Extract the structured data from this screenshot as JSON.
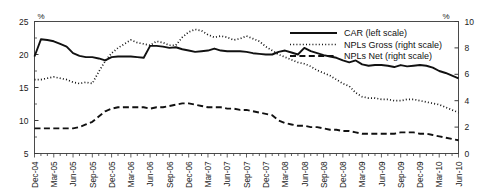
{
  "figure": {
    "title_partial": "",
    "left_unit": "%",
    "right_unit": "%"
  },
  "axes": {
    "left_ticks": [
      "25",
      "20",
      "15",
      "10",
      "5"
    ],
    "right_ticks": [
      "10",
      "8",
      "6",
      "4",
      "2",
      "0"
    ],
    "x_ticks": [
      "Dec-04",
      "Mar-05",
      "Jun-05",
      "Sep-05",
      "Dec-05",
      "Mar-06",
      "Jun-06",
      "Sep-06",
      "Dec-06",
      "Mar-07",
      "Jun-07",
      "Sep-07",
      "Dec-07",
      "Mar-08",
      "Jun-08",
      "Sep-08",
      "Dec-08",
      "Mar-09",
      "Jun-09",
      "Sep-09",
      "Dec-09",
      "Mar-10",
      "Jun-10"
    ]
  },
  "legend": {
    "items": [
      {
        "label": "CAR (left scale)",
        "style": "solid",
        "color": "#111111"
      },
      {
        "label": "NPLs Gross (right scale)",
        "style": "dotted",
        "color": "#111111"
      },
      {
        "label": "NPLs Net (right scale)",
        "style": "dashed",
        "color": "#111111"
      }
    ]
  },
  "chart_data": {
    "type": "line",
    "title": "",
    "xlabel": "",
    "ylabel": "%",
    "ylabel_right": "%",
    "ylim": [
      5,
      25
    ],
    "ylim_right": [
      0,
      10
    ],
    "grid": false,
    "legend_position": "top-right",
    "x": [
      "Dec-04",
      "Jan-05",
      "Feb-05",
      "Mar-05",
      "Apr-05",
      "May-05",
      "Jun-05",
      "Jul-05",
      "Aug-05",
      "Sep-05",
      "Oct-05",
      "Nov-05",
      "Dec-05",
      "Jan-06",
      "Feb-06",
      "Mar-06",
      "Apr-06",
      "May-06",
      "Jun-06",
      "Jul-06",
      "Aug-06",
      "Sep-06",
      "Oct-06",
      "Nov-06",
      "Dec-06",
      "Jan-07",
      "Feb-07",
      "Mar-07",
      "Apr-07",
      "May-07",
      "Jun-07",
      "Jul-07",
      "Aug-07",
      "Sep-07",
      "Oct-07",
      "Nov-07",
      "Dec-07",
      "Jan-08",
      "Feb-08",
      "Mar-08",
      "Apr-08",
      "May-08",
      "Jun-08",
      "Jul-08",
      "Aug-08",
      "Sep-08",
      "Oct-08",
      "Nov-08",
      "Dec-08",
      "Jan-09",
      "Feb-09",
      "Mar-09",
      "Apr-09",
      "May-09",
      "Jun-09",
      "Jul-09",
      "Aug-09",
      "Sep-09",
      "Oct-09",
      "Nov-09",
      "Dec-09",
      "Jan-10",
      "Feb-10",
      "Mar-10",
      "Apr-10",
      "May-10",
      "Jun-10"
    ],
    "series": [
      {
        "name": "CAR (left scale)",
        "axis": "left",
        "style": "solid",
        "values": [
          19.7,
          22.3,
          22.2,
          22.0,
          21.6,
          21.2,
          20.2,
          19.8,
          19.6,
          19.6,
          19.4,
          19.1,
          19.6,
          19.7,
          19.7,
          19.7,
          19.6,
          19.5,
          21.3,
          21.3,
          21.2,
          21.0,
          21.1,
          20.8,
          20.6,
          20.4,
          20.5,
          20.6,
          20.9,
          20.6,
          20.5,
          20.5,
          20.5,
          20.4,
          20.2,
          20.1,
          20.0,
          20.0,
          20.4,
          20.6,
          20.3,
          20.0,
          21.0,
          20.5,
          20.2,
          19.9,
          19.7,
          19.5,
          19.1,
          18.8,
          19.1,
          18.5,
          18.3,
          18.4,
          18.4,
          18.3,
          18.1,
          18.4,
          18.2,
          18.3,
          18.4,
          18.3,
          18.0,
          17.5,
          17.2,
          16.8,
          16.4
        ]
      },
      {
        "name": "NPLs Gross (right scale)",
        "axis": "right",
        "style": "dotted",
        "values": [
          5.6,
          5.6,
          5.7,
          5.8,
          5.7,
          5.6,
          5.4,
          5.3,
          5.4,
          5.3,
          6.2,
          7.0,
          7.6,
          8.0,
          8.3,
          8.6,
          8.4,
          8.3,
          8.2,
          8.5,
          8.4,
          8.2,
          8.2,
          8.8,
          9.2,
          9.4,
          9.3,
          9.0,
          8.8,
          8.9,
          8.8,
          8.6,
          8.7,
          8.9,
          8.7,
          8.5,
          8.1,
          7.8,
          7.5,
          7.3,
          7.1,
          6.9,
          6.8,
          6.6,
          6.3,
          6.1,
          5.9,
          5.6,
          5.3,
          5.1,
          4.6,
          4.3,
          4.2,
          4.2,
          4.1,
          4.1,
          4.0,
          4.0,
          4.1,
          4.1,
          4.0,
          3.9,
          3.8,
          3.7,
          3.5,
          3.3,
          3.1
        ]
      },
      {
        "name": "NPLs Net (right scale)",
        "axis": "right",
        "style": "dashed",
        "values": [
          1.9,
          1.9,
          1.9,
          1.9,
          1.9,
          1.9,
          1.9,
          2.0,
          2.2,
          2.4,
          2.8,
          3.2,
          3.4,
          3.5,
          3.5,
          3.5,
          3.5,
          3.5,
          3.4,
          3.5,
          3.5,
          3.6,
          3.7,
          3.8,
          3.8,
          3.7,
          3.6,
          3.5,
          3.5,
          3.5,
          3.4,
          3.4,
          3.3,
          3.3,
          3.2,
          3.1,
          3.0,
          2.9,
          2.5,
          2.3,
          2.2,
          2.1,
          2.1,
          2.0,
          2.0,
          1.9,
          1.8,
          1.8,
          1.7,
          1.7,
          1.6,
          1.5,
          1.5,
          1.5,
          1.5,
          1.5,
          1.5,
          1.6,
          1.6,
          1.6,
          1.5,
          1.5,
          1.4,
          1.3,
          1.2,
          1.1,
          1.0
        ]
      }
    ]
  }
}
